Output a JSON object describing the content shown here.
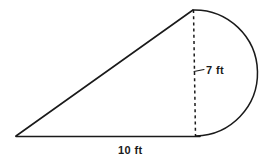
{
  "figure": {
    "background_color": "#ffffff",
    "stroke_color": "#1a1a1a",
    "labels": {
      "height": "7 ft",
      "base": "10 ft"
    },
    "parts": [
      {
        "name": "triangle",
        "shape": "right-triangle",
        "vertices": [
          [
            16,
            136
          ],
          [
            193,
            10
          ],
          [
            196,
            136
          ]
        ]
      },
      {
        "name": "semicircle",
        "shape": "semicircle",
        "diameter_endpoints": [
          [
            193,
            10
          ],
          [
            196,
            136
          ]
        ],
        "bulge_direction": "right",
        "rightmost_x": 250
      },
      {
        "name": "height-dashed-line",
        "shape": "dashed-vertical-segment",
        "from": [
          193,
          10
        ],
        "to": [
          195,
          136
        ]
      },
      {
        "name": "height-tick",
        "shape": "tick-mark",
        "from": [
          193,
          71
        ],
        "to": [
          203,
          70
        ]
      },
      {
        "name": "base-line",
        "shape": "horizontal-segment",
        "from": [
          16,
          136
        ],
        "to": [
          200,
          136
        ]
      }
    ],
    "measurements": {
      "height_value": 7,
      "height_unit": "ft",
      "base_value": 10,
      "base_unit": "ft"
    }
  }
}
